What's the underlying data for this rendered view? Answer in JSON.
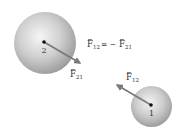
{
  "diagram": {
    "equation": {
      "lhs_symbol": "F",
      "lhs_sub": "12",
      "operator": "= −",
      "rhs_symbol": "F",
      "rhs_sub": "21"
    },
    "spheres": [
      {
        "id": "2",
        "label": "2",
        "center": [
          45,
          43
        ],
        "radius": 31,
        "force": {
          "symbol": "F",
          "sub": "21",
          "tip": [
            80,
            63
          ]
        }
      },
      {
        "id": "1",
        "label": "1",
        "center": [
          151.5,
          106.5
        ],
        "radius": 20.5,
        "force": {
          "symbol": "F",
          "sub": "12",
          "tip": [
            116,
            84
          ]
        }
      }
    ],
    "colors": {
      "sphere_light": "#f4f4f4",
      "sphere_dark": "#9a9a9a",
      "arrow": "#7a7a7a",
      "dot": "#111111",
      "text": "#333333"
    }
  }
}
